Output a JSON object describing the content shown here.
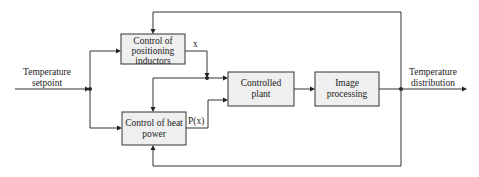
{
  "diagram": {
    "title": "",
    "blocks": {
      "positioning": [
        "Control of",
        "positioning",
        "inductors"
      ],
      "heat": [
        "Control of heat",
        "power"
      ],
      "plant": [
        "Controlled",
        "plant"
      ],
      "image": [
        "Image",
        "processing"
      ]
    },
    "input_label": [
      "Temperature",
      "setpoint"
    ],
    "output_label": [
      "Temperature",
      "distribution"
    ],
    "signal_x": "x",
    "signal_px": "P(x)"
  }
}
